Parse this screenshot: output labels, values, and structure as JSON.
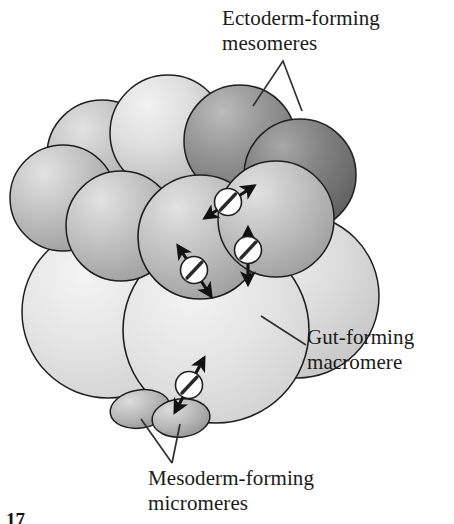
{
  "figure": {
    "figure_number": "17",
    "background_color": "#ffffff",
    "outline_color": "#1a1a1a"
  },
  "labels": {
    "ectoderm": {
      "line1": "Ectoderm-forming",
      "line2": "mesomeres",
      "text": "Ectoderm-forming\nmesomeres"
    },
    "gut": {
      "line1": "Gut-forming",
      "line2": "macromere",
      "text": "Gut-forming\nmacromere"
    },
    "mesoderm": {
      "line1": "Mesoderm-forming",
      "line2": "micromeres",
      "text": "Mesoderm-forming\nmicromeres"
    }
  },
  "cells": {
    "mesomeres": {
      "name": "mesomeres",
      "count": 8,
      "fill_light": "#d8d8d8",
      "fill_mid": "#b4b4b4",
      "fill_dark": "#8a8a8a",
      "fill_darkest": "#6f6f6f"
    },
    "macromeres": {
      "name": "macromeres",
      "count": 4,
      "fill": "#dcdcdc",
      "fill_highlight": "#f0f0f0"
    },
    "micromeres": {
      "name": "micromeres",
      "count": 2,
      "fill": "#b9b9b9",
      "fill_highlight": "#d6d6d6"
    }
  },
  "spindles": {
    "name": "mitotic-spindle",
    "count": 3,
    "body_fill": "#ffffff",
    "slash_color": "#2a2a2a",
    "arrow_color": "#111111",
    "description": "white circle with diagonal spindle slash and double-headed division-axis arrow"
  },
  "leaders": {
    "ectoderm": "v-shaped-double-leader",
    "gut": "single-diagonal-leader",
    "mesoderm": "v-shaped-double-leader",
    "color": "#303030"
  }
}
